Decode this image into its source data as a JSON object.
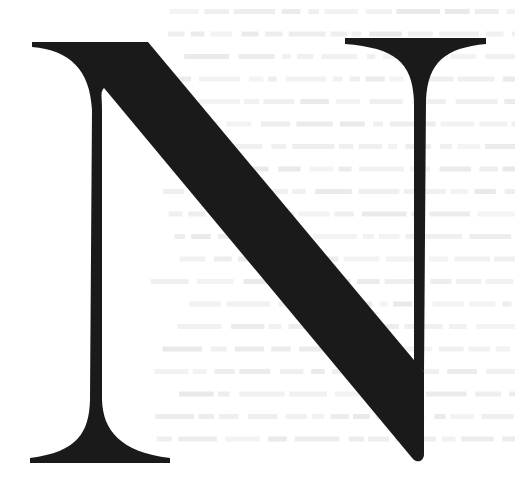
{
  "image": {
    "width": 521,
    "height": 487,
    "background_color": "#ffffff"
  },
  "glyph": {
    "character": "N",
    "style": "serif drop-cap letterform",
    "fill_color": "#1a1a1a"
  },
  "background_texture": {
    "description": "faint illegible ghosted text lines",
    "line_color": "#e9e9e9",
    "line_count": 20,
    "line_spacing_px": 22.5,
    "first_line_y": 12
  }
}
